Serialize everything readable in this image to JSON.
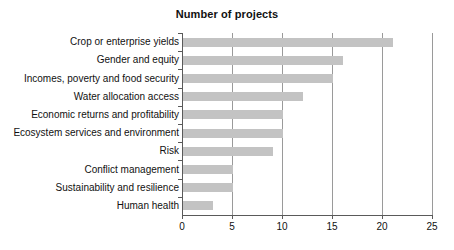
{
  "chart_data": {
    "type": "bar",
    "orientation": "horizontal",
    "title": "Number of projects",
    "xlabel": "",
    "ylabel": "",
    "xlim": [
      0,
      25
    ],
    "xticks": [
      0,
      5,
      10,
      15,
      20,
      25
    ],
    "grid": true,
    "grid_axis": "x",
    "legend": false,
    "bar_color": "#c3c3c3",
    "axis_color": "#5a5a5a",
    "categories": [
      "Crop or enterprise yields",
      "Gender and equity",
      "Incomes, poverty and food security",
      "Water allocation access",
      "Economic returns and profitability",
      "Ecosystem services and environment",
      "Risk",
      "Conflict management",
      "Sustainability and resilience",
      "Human health"
    ],
    "values": [
      21,
      16,
      15,
      12,
      10,
      10,
      9,
      5,
      5,
      3
    ]
  }
}
